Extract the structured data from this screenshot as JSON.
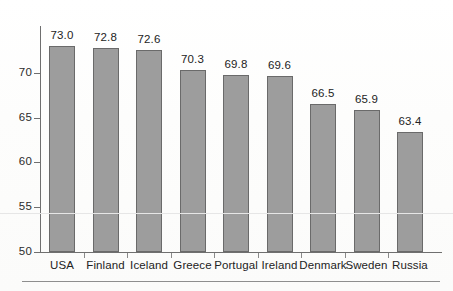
{
  "chart_data": {
    "type": "bar",
    "title": "",
    "subtitle": "",
    "xlabel": "",
    "ylabel": "",
    "categories": [
      "USA",
      "Finland",
      "Iceland",
      "Greece",
      "Portugal",
      "Ireland",
      "Denmark",
      "Sweden",
      "Russia"
    ],
    "values": [
      73.0,
      72.8,
      72.6,
      70.3,
      69.8,
      69.6,
      66.5,
      65.9,
      63.4
    ],
    "value_labels": [
      "73.0",
      "72.8",
      "72.6",
      "70.3",
      "69.8",
      "69.6",
      "66.5",
      "65.9",
      "63.4"
    ],
    "ylim": [
      50,
      75
    ],
    "yticks": [
      50,
      55,
      60,
      65,
      70
    ],
    "ytick_labels": [
      "50",
      "55",
      "60",
      "65",
      "70"
    ],
    "grid": false,
    "legend": null,
    "legend_position": "none",
    "bar_color": "#9d9d9d",
    "bar_edge_color": "#6a6a6a",
    "axis_color": "#6f6f6f",
    "text_color": "#232323",
    "background_color": "#fdfdfd",
    "data_labels_shown": true,
    "annotations": []
  }
}
